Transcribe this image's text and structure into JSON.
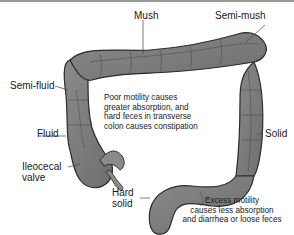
{
  "figure": {
    "labels": {
      "mush": "Mush",
      "semi_mush": "Semi-mush",
      "semi_fluid": "Semi-fluid",
      "fluid": "Fluid",
      "solid": "Solid",
      "ileocecal_valve_line1": "Ileocecal",
      "ileocecal_valve_line2": "valve",
      "hard_solid_line1": "Hard",
      "hard_solid_line2": "solid"
    },
    "notes": {
      "poor_motility": [
        "Poor motility causes",
        "greater absorption, and",
        "hard feces in transverse",
        "colon causes constipation"
      ],
      "excess_motility": [
        "Excess motility",
        "causes less absorption",
        "and diarrhea or loose feces"
      ]
    },
    "colors": {
      "colon_fill": "#7f7f7f",
      "colon_outline": "#2b2b2b",
      "label_text": "#1a1a1a",
      "leader_line": "#444444"
    }
  }
}
